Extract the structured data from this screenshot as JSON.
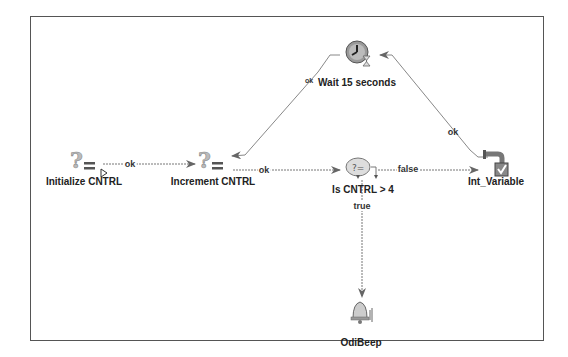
{
  "diagram": {
    "nodes": [
      {
        "id": "initialize",
        "label": "Initialize CNTRL",
        "icon": "set-variable-icon"
      },
      {
        "id": "increment",
        "label": "Increment CNTRL",
        "icon": "set-variable-icon"
      },
      {
        "id": "wait",
        "label": "Wait 15 seconds",
        "icon": "wait-clock-icon"
      },
      {
        "id": "evaluate",
        "label": "Is CNTRL > 4",
        "icon": "evaluate-variable-icon"
      },
      {
        "id": "int_variable",
        "label": "Int_Variable",
        "icon": "refresh-variable-icon"
      },
      {
        "id": "beep",
        "label": "OdiBeep",
        "icon": "bell-icon"
      }
    ],
    "edges": [
      {
        "from": "initialize",
        "to": "increment",
        "label": "ok"
      },
      {
        "from": "increment",
        "to": "evaluate",
        "label": "ok"
      },
      {
        "from": "evaluate",
        "to": "int_variable",
        "label": "false"
      },
      {
        "from": "int_variable",
        "to": "wait",
        "label": "ok"
      },
      {
        "from": "wait",
        "to": "increment",
        "label": "ok"
      },
      {
        "from": "evaluate",
        "to": "beep",
        "label": "true"
      }
    ]
  },
  "colors": {
    "frame": "#555555",
    "edge": "#777777",
    "text": "#222222"
  }
}
